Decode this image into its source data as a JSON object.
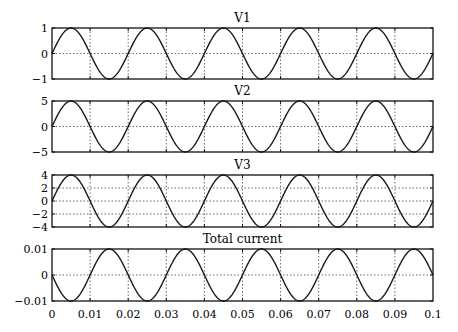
{
  "chart_data": [
    {
      "type": "line",
      "title": "V1",
      "xlabel": "",
      "ylabel": "",
      "xlim": [
        0,
        0.1
      ],
      "ylim": [
        -1,
        1
      ],
      "yticks": [
        -1,
        0,
        1
      ],
      "ytick_labels": [
        "−1",
        "0",
        "1"
      ],
      "grid": true,
      "series": [
        {
          "name": "V1",
          "function": "1*sin(2*pi*50*t)",
          "amplitude": 1,
          "frequency_hz": 50,
          "phase": 0
        }
      ]
    },
    {
      "type": "line",
      "title": "V2",
      "xlabel": "",
      "ylabel": "",
      "xlim": [
        0,
        0.1
      ],
      "ylim": [
        -5,
        5
      ],
      "yticks": [
        -5,
        0,
        5
      ],
      "ytick_labels": [
        "−5",
        "0",
        "5"
      ],
      "grid": true,
      "series": [
        {
          "name": "V2",
          "function": "5*sin(2*pi*50*t)",
          "amplitude": 5,
          "frequency_hz": 50,
          "phase": 0
        }
      ]
    },
    {
      "type": "line",
      "title": "V3",
      "xlabel": "",
      "ylabel": "",
      "xlim": [
        0,
        0.1
      ],
      "ylim": [
        -4,
        4
      ],
      "yticks": [
        -4,
        -2,
        0,
        2,
        4
      ],
      "ytick_labels": [
        "−4",
        "−2",
        "0",
        "2",
        "4"
      ],
      "grid": true,
      "series": [
        {
          "name": "V3",
          "function": "4*sin(2*pi*50*t)",
          "amplitude": 4,
          "frequency_hz": 50,
          "phase": 0
        }
      ]
    },
    {
      "type": "line",
      "title": "Total current",
      "xlabel": "",
      "ylabel": "",
      "xlim": [
        0,
        0.1
      ],
      "ylim": [
        -0.01,
        0.01
      ],
      "yticks": [
        -0.01,
        0,
        0.01
      ],
      "ytick_labels": [
        "−0.01",
        "0",
        "0.01"
      ],
      "xticks": [
        0,
        0.01,
        0.02,
        0.03,
        0.04,
        0.05,
        0.06,
        0.07,
        0.08,
        0.09,
        0.1
      ],
      "xtick_labels": [
        "0",
        "0.01",
        "0.02",
        "0.03",
        "0.04",
        "0.05",
        "0.06",
        "0.07",
        "0.08",
        "0.09",
        "0.1"
      ],
      "grid": true,
      "series": [
        {
          "name": "Total current",
          "function": "-0.01*sin(2*pi*50*t)",
          "amplitude": 0.01,
          "frequency_hz": 50,
          "phase": 180
        }
      ]
    }
  ],
  "layout": {
    "plot_left": 52,
    "plot_right": 433,
    "panels": [
      {
        "top": 28,
        "bottom": 79,
        "title_y": 22
      },
      {
        "top": 101,
        "bottom": 152,
        "title_y": 95
      },
      {
        "top": 175,
        "bottom": 227,
        "title_y": 169
      },
      {
        "top": 249,
        "bottom": 301,
        "title_y": 243
      }
    ],
    "xtick_label_y": 318,
    "line_color": "#1a1a1a",
    "grid_color": "#444444"
  }
}
